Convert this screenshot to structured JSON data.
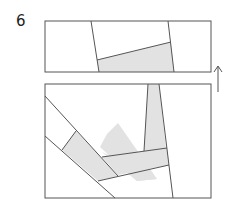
{
  "step": {
    "number": "6"
  },
  "colors": {
    "stroke": "#555555",
    "fill": "#e2e2e2",
    "background": "#ffffff"
  },
  "diagram": {
    "top_panel": {
      "x": 45,
      "y": 21,
      "width": 166,
      "height": 51
    },
    "bottom_panel": {
      "x": 45,
      "y": 84,
      "width": 166,
      "height": 114
    },
    "arrow": {
      "direction": "up",
      "x": 218,
      "y1": 92,
      "y2": 66
    }
  }
}
